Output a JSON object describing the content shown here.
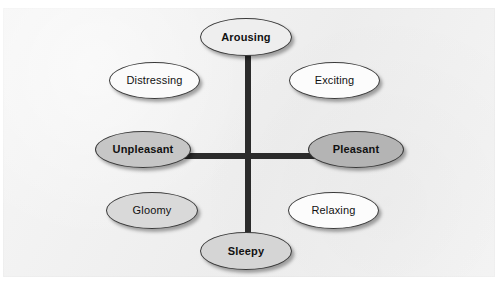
{
  "figure": {
    "background_color": "#ffffff",
    "panel_color": "#f1f1f1",
    "axis_color": "#2b2b2b",
    "node_border_color": "#3a3a3a"
  },
  "axes": {
    "vertical": {
      "name": "arousal-axis",
      "top_label": "Arousing",
      "bottom_label": "Sleepy"
    },
    "horizontal": {
      "name": "valence-axis",
      "left_label": "Unpleasant",
      "right_label": "Pleasant"
    }
  },
  "nodes": [
    {
      "id": "arousing",
      "label": "Arousing",
      "fill": "#eeeeee",
      "weight": "bold",
      "position": "top",
      "x": 200,
      "y": 18,
      "width": 92,
      "height": 38
    },
    {
      "id": "distressing",
      "label": "Distressing",
      "fill": "#fbfbfb",
      "weight": "regular",
      "position": "upper-left",
      "x": 109,
      "y": 62,
      "width": 91,
      "height": 37
    },
    {
      "id": "exciting",
      "label": "Exciting",
      "fill": "#fcfcfc",
      "weight": "regular",
      "position": "upper-right",
      "x": 289,
      "y": 62,
      "width": 91,
      "height": 37
    },
    {
      "id": "unpleasant",
      "label": "Unpleasant",
      "fill": "#c6c6c6",
      "weight": "bold",
      "position": "left",
      "x": 95,
      "y": 131,
      "width": 96,
      "height": 37
    },
    {
      "id": "pleasant",
      "label": "Pleasant",
      "fill": "#b4b4b4",
      "weight": "bold",
      "position": "right",
      "x": 308,
      "y": 131,
      "width": 96,
      "height": 37
    },
    {
      "id": "gloomy",
      "label": "Gloomy",
      "fill": "#d9d9d9",
      "weight": "regular",
      "position": "lower-left",
      "x": 106,
      "y": 192,
      "width": 92,
      "height": 37
    },
    {
      "id": "relaxing",
      "label": "Relaxing",
      "fill": "#fcfcfc",
      "weight": "regular",
      "position": "lower-right",
      "x": 288,
      "y": 192,
      "width": 91,
      "height": 37
    },
    {
      "id": "sleepy",
      "label": "Sleepy",
      "fill": "#d5d5d5",
      "weight": "bold",
      "position": "bottom",
      "x": 200,
      "y": 232,
      "width": 92,
      "height": 38
    }
  ]
}
